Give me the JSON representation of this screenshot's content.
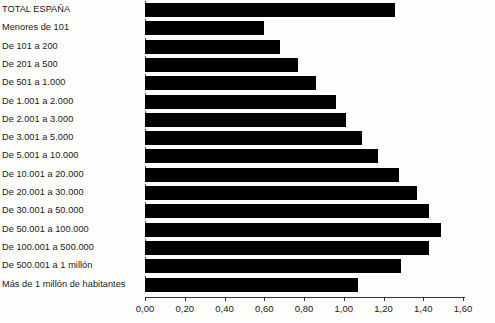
{
  "chart_data": {
    "type": "bar",
    "orientation": "horizontal",
    "title": "",
    "subtitle": "",
    "xlabel": "",
    "ylabel": "",
    "xlim": [
      0.0,
      1.6
    ],
    "grid": false,
    "legend": null,
    "bar_color": "#000000",
    "background_color": "#fdfdfc",
    "axis_color": "#333333",
    "categories": [
      "TOTAL ESPAÑA",
      "Menores de 101",
      "De 101 a 200",
      "De 201 a 500",
      "De 501 a 1.000",
      "De 1.001 a 2.000",
      "De 2.001 a 3.000",
      "De 3.001 a 5.000",
      "De 5.001 a 10.000",
      "De 10.001 a 20.000",
      "De 20.001 a 30.000",
      "De 30.001 a 50.000",
      "De 50.001 a 100.000",
      "De 100.001 a 500.000",
      "De 500.001 a 1 millón",
      "Más de 1 millón de habitantes"
    ],
    "values": [
      1.26,
      0.6,
      0.68,
      0.77,
      0.86,
      0.96,
      1.01,
      1.09,
      1.17,
      1.28,
      1.37,
      1.43,
      1.49,
      1.43,
      1.29,
      1.07
    ],
    "xticks": [
      0.0,
      0.2,
      0.4,
      0.6,
      0.8,
      1.0,
      1.2,
      1.4,
      1.6
    ],
    "xtick_labels": [
      "0,00",
      "0,20",
      "0,40",
      "0,60",
      "0,80",
      "1,00",
      "1,20",
      "1,40",
      "1,60"
    ]
  }
}
